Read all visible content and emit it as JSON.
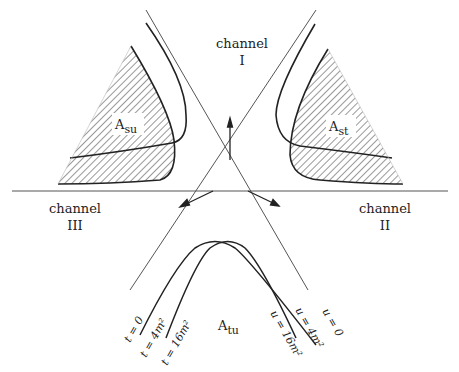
{
  "diagram": {
    "channels": [
      {
        "id": "I",
        "name_label": "channel",
        "numeral": "I"
      },
      {
        "id": "II",
        "name_label": "channel",
        "numeral": "II"
      },
      {
        "id": "III",
        "name_label": "channel",
        "numeral": "III"
      }
    ],
    "regions": [
      {
        "id": "Asu",
        "base": "A",
        "sub": "su"
      },
      {
        "id": "Ast",
        "base": "A",
        "sub": "st"
      },
      {
        "id": "Atu",
        "base": "A",
        "sub": "tu"
      }
    ],
    "boundary_labels": {
      "t0": "t = 0",
      "t4": "t = 4m²",
      "t16": "t = 16m²",
      "u0": "u = 0",
      "u4": "u = 4m²",
      "u16": "u = 16m²"
    },
    "colors": {
      "line": "#333333",
      "thin_line": "#555555",
      "hatch": "#333333",
      "background": "#ffffff"
    }
  }
}
